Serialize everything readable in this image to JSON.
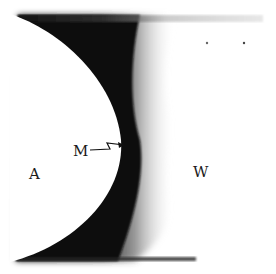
{
  "figure": {
    "labels": {
      "region_left": "A",
      "interface_marker": "M",
      "region_right": "W"
    },
    "colors": {
      "band_dark": "#111111",
      "background": "#ffffff"
    }
  }
}
